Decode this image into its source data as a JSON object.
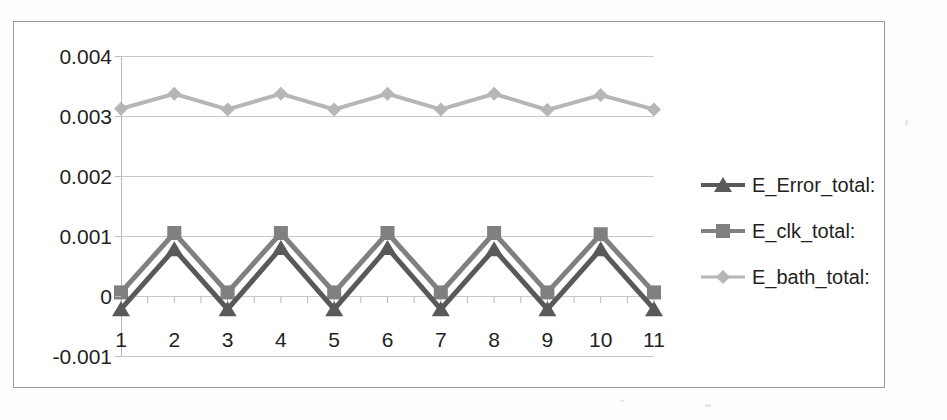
{
  "chart_data": {
    "type": "line",
    "title": "",
    "xlabel": "",
    "ylabel": "",
    "categories": [
      "1",
      "2",
      "3",
      "4",
      "5",
      "6",
      "7",
      "8",
      "9",
      "10",
      "11"
    ],
    "x": [
      1,
      2,
      3,
      4,
      5,
      6,
      7,
      8,
      9,
      10,
      11
    ],
    "ylim": [
      -0.001,
      0.004
    ],
    "yticks": [
      0.004,
      0.003,
      0.002,
      0.001,
      0,
      -0.001
    ],
    "ytick_labels": [
      "0.004",
      "0.003",
      "0.002",
      "0.001",
      "0",
      "-0.001"
    ],
    "grid": true,
    "legend_position": "right",
    "series": [
      {
        "name": "E_Error_total:",
        "marker": "triangle",
        "color": "#595959",
        "values": [
          -0.00022,
          0.00078,
          -0.00022,
          0.0008,
          -0.00022,
          0.0008,
          -0.00022,
          0.00078,
          -0.00022,
          0.00078,
          -0.00022
        ]
      },
      {
        "name": "E_clk_total:",
        "marker": "square",
        "color": "#808080",
        "values": [
          6e-05,
          0.00105,
          6e-05,
          0.00105,
          6e-05,
          0.00105,
          6e-05,
          0.00105,
          6e-05,
          0.00103,
          6e-05
        ]
      },
      {
        "name": "E_bath_total:",
        "marker": "diamond",
        "color": "#b6b6b6",
        "values": [
          0.00312,
          0.00337,
          0.00311,
          0.00337,
          0.00311,
          0.00337,
          0.00311,
          0.00337,
          0.0031,
          0.00335,
          0.00311
        ]
      }
    ]
  },
  "legend": {
    "items": [
      {
        "label": "E_Error_total:",
        "color": "#595959",
        "marker": "triangle"
      },
      {
        "label": "E_clk_total:",
        "color": "#808080",
        "marker": "square"
      },
      {
        "label": "E_bath_total:",
        "color": "#b6b6b6",
        "marker": "diamond"
      }
    ]
  },
  "axes": {
    "y_tick_labels": [
      "0.004",
      "0.003",
      "0.002",
      "0.001",
      "0",
      "-0.001"
    ],
    "x_tick_labels": [
      "1",
      "2",
      "3",
      "4",
      "5",
      "6",
      "7",
      "8",
      "9",
      "10",
      "11"
    ]
  },
  "colors": {
    "grid": "#c8c8c4",
    "axis": "#b9b9b5",
    "frame": "#9a9a96",
    "text": "#231f20",
    "background": "#ffffff"
  }
}
